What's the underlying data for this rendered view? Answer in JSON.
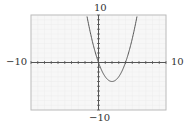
{
  "chart_data": {
    "type": "line",
    "title": "",
    "function": "f(x) = x^2 - 4x",
    "xlabel": "",
    "ylabel": "",
    "xlim": [
      -10,
      10
    ],
    "ylim": [
      -10,
      10
    ],
    "x_tick_step": 1,
    "y_tick_step": 1,
    "grid": true,
    "legend": null,
    "window_labels": {
      "xmin": "−10",
      "xmax": "10",
      "ymin": "−10",
      "ymax": "10"
    },
    "series": [
      {
        "name": "parabola",
        "x": [
          -1.74,
          -1,
          0,
          1,
          2,
          3,
          4,
          5,
          5.74
        ],
        "y": [
          10,
          5,
          0,
          -3,
          -4,
          -3,
          0,
          5,
          10
        ]
      }
    ],
    "key_points": {
      "roots": [
        [
          0,
          0
        ],
        [
          4,
          0
        ]
      ],
      "vertex": [
        2,
        -4
      ]
    }
  },
  "colors": {
    "plot_background": "#f7f7f7",
    "grid": "#ececec",
    "frame": "#bdbdbd",
    "axis": "#555555",
    "curve": "#555555"
  }
}
